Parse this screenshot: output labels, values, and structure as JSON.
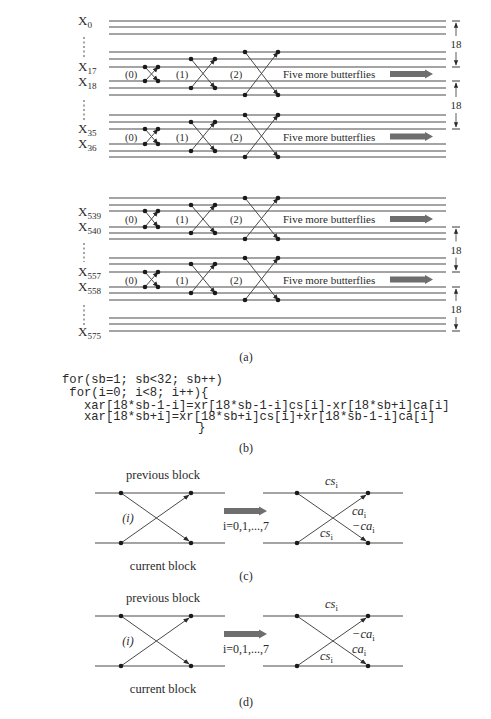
{
  "panel_a": {
    "caption": "(a)",
    "row_labels": [
      {
        "base": "X",
        "sub": "0"
      },
      {
        "base": "X",
        "sub": "17"
      },
      {
        "base": "X",
        "sub": "18"
      },
      {
        "base": "X",
        "sub": "35"
      },
      {
        "base": "X",
        "sub": "36"
      },
      {
        "base": "X",
        "sub": "539"
      },
      {
        "base": "X",
        "sub": "540"
      },
      {
        "base": "X",
        "sub": "557"
      },
      {
        "base": "X",
        "sub": "558"
      },
      {
        "base": "X",
        "sub": "575"
      }
    ],
    "butterfly_labels": [
      "(0)",
      "(1)",
      "(2)"
    ],
    "more_text": "Five more butterflies",
    "span_label": "18"
  },
  "panel_b": {
    "caption": "(b)",
    "code_lines": [
      "for(sb=1; sb<32; sb++)",
      " for(i=0; i<8; i++){",
      "   xar[18*sb-1-i]=xr[18*sb-1-i]cs[i]-xr[18*sb+i]ca[i]",
      "   xar[18*sb+i]=xr[18*sb+i]cs[i]+xr[18*sb-1-i]ca[i]",
      "                }"
    ]
  },
  "panel_c": {
    "caption": "(c)",
    "top_label": "previous block",
    "bottom_label": "current block",
    "index_label": "(i)",
    "range_label": "i=0,1,...,7",
    "cs_top": {
      "base": "cs",
      "sub": "i"
    },
    "cs_bottom": {
      "base": "cs",
      "sub": "i"
    },
    "coef_upper": {
      "base": "ca",
      "sub": "i"
    },
    "coef_lower": {
      "base": "−ca",
      "sub": "i"
    }
  },
  "panel_d": {
    "caption": "(d)",
    "top_label": "previous block",
    "bottom_label": "current block",
    "index_label": "(i)",
    "range_label": "i=0,1,...,7",
    "cs_top": {
      "base": "cs",
      "sub": "i"
    },
    "cs_bottom": {
      "base": "cs",
      "sub": "i"
    },
    "coef_upper": {
      "base": "−ca",
      "sub": "i"
    },
    "coef_lower": {
      "base": "ca",
      "sub": "i"
    }
  },
  "colors": {
    "line": "#4a4a4a",
    "arrow_fill": "#6e6e6e",
    "text": "#2a2a2a"
  }
}
